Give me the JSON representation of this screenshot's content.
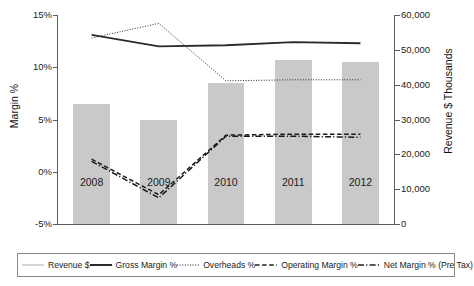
{
  "chart_data": {
    "type": "bar",
    "title": "",
    "categories": [
      "2008",
      "2009",
      "2010",
      "2011",
      "2012"
    ],
    "xlabel": "",
    "ylabel": "Margin %",
    "ylabel_secondary": "Revenue $ Thousands",
    "ylim": [
      -5,
      15
    ],
    "ylim_secondary": [
      0,
      60000
    ],
    "yticks": [
      "15%",
      "10%",
      "5%",
      "0%",
      "-5%"
    ],
    "ytick_values": [
      15,
      10,
      5,
      0,
      -5
    ],
    "yticks_secondary": [
      "60,000",
      "50,000",
      "40,000",
      "30,000",
      "20,000",
      "10,000",
      "0"
    ],
    "ytick_values_secondary": [
      60000,
      50000,
      40000,
      30000,
      20000,
      10000,
      0
    ],
    "grid": true,
    "legend_position": "bottom",
    "series": [
      {
        "name": "Revenue $",
        "render": "bar",
        "axis": "secondary",
        "style": "thin-solid",
        "color": "#c9c9c9",
        "values": [
          34400,
          29800,
          40500,
          47000,
          46500
        ]
      },
      {
        "name": "Gross Margin %",
        "render": "line",
        "axis": "primary",
        "style": "thick-solid",
        "color": "#2b2b2b",
        "values": [
          13.1,
          12.0,
          12.1,
          12.4,
          12.3
        ]
      },
      {
        "name": "Overheads %",
        "render": "line",
        "axis": "primary",
        "style": "dotted",
        "color": "#2b2b2b",
        "values": [
          12.8,
          14.2,
          8.7,
          8.8,
          8.8
        ]
      },
      {
        "name": "Operating Margin %",
        "render": "line",
        "axis": "primary",
        "style": "dashed",
        "color": "#1a1a1a",
        "values": [
          1.2,
          -2.2,
          3.5,
          3.6,
          3.6
        ]
      },
      {
        "name": "Net Margin % (Pre Tax)",
        "render": "line",
        "axis": "primary",
        "style": "dash-dot",
        "color": "#1a1a1a",
        "values": [
          1.0,
          -2.5,
          3.4,
          3.4,
          3.3
        ]
      }
    ]
  },
  "legend": {
    "items": [
      {
        "label": "Revenue $",
        "swatch": "thin-solid-swatch"
      },
      {
        "label": "Gross Margin %",
        "swatch": "thick-solid-swatch"
      },
      {
        "label": "Overheads %",
        "swatch": "dotted-swatch"
      },
      {
        "label": "Operating Margin %",
        "swatch": "dashed-swatch"
      },
      {
        "label": "Net Margin % (Pre Tax)",
        "swatch": "dash-dot-swatch"
      }
    ]
  },
  "colors": {
    "bar_fill": "#c9c9c9",
    "grid": "#b9b9b9",
    "axis": "#5e5e5e",
    "line": "#1f1f1f",
    "text": "#1b1b1b",
    "background": "#ffffff"
  }
}
